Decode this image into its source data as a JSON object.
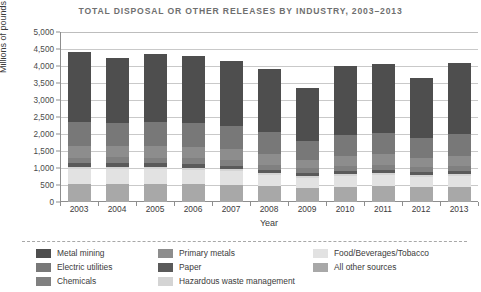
{
  "chart_data": {
    "type": "bar",
    "subtype": "stacked-bar",
    "title": "TOTAL DISPOSAL OR OTHER RELEASES BY INDUSTRY, 2003–2013",
    "xlabel": "Year",
    "ylabel": "Millions of pounds",
    "categories": [
      "2003",
      "2004",
      "2005",
      "2006",
      "2007",
      "2008",
      "2009",
      "2010",
      "2011",
      "2012",
      "2013"
    ],
    "ylim": [
      0,
      5000
    ],
    "ytick_labels": [
      "5,000",
      "4,500",
      "4,000",
      "3,500",
      "3,000",
      "2,500",
      "2,000",
      "1,500",
      "1,000",
      "500",
      "0"
    ],
    "ytick_values": [
      5000,
      4500,
      4000,
      3500,
      3000,
      2500,
      2000,
      1500,
      1000,
      500,
      0
    ],
    "grid": "horizontal",
    "legend_position": "bottom",
    "stack_order_bottom_to_top": [
      "All other sources",
      "Food/Beverages/Tobacco",
      "Hazardous waste management",
      "Paper",
      "Chemicals",
      "Primary metals",
      "Electric utilities",
      "Metal mining"
    ],
    "series": [
      {
        "name": "All other sources",
        "color": "#a8a8a8",
        "values": [
          530,
          540,
          530,
          520,
          500,
          470,
          420,
          450,
          470,
          440,
          450
        ]
      },
      {
        "name": "Food/Beverages/Tobacco",
        "color": "#e2e2e2",
        "values": [
          430,
          430,
          430,
          420,
          400,
          330,
          290,
          320,
          330,
          300,
          320
        ]
      },
      {
        "name": "Hazardous waste management",
        "color": "#d4d4d4",
        "values": [
          60,
          60,
          60,
          60,
          60,
          50,
          50,
          50,
          50,
          50,
          50
        ]
      },
      {
        "name": "Paper",
        "color": "#5a5a5a",
        "values": [
          120,
          120,
          120,
          120,
          110,
          100,
          90,
          100,
          100,
          90,
          100
        ]
      },
      {
        "name": "Chemicals",
        "color": "#808080",
        "values": [
          170,
          170,
          170,
          170,
          160,
          150,
          140,
          150,
          150,
          140,
          150
        ]
      },
      {
        "name": "Primary metals",
        "color": "#8d8d8d",
        "values": [
          330,
          320,
          330,
          330,
          320,
          300,
          260,
          280,
          300,
          270,
          290
        ]
      },
      {
        "name": "Electric utilities",
        "color": "#787878",
        "values": [
          700,
          690,
          700,
          700,
          680,
          650,
          560,
          620,
          640,
          600,
          630
        ]
      },
      {
        "name": "Metal mining",
        "color": "#4e4e4e",
        "values": [
          2060,
          1920,
          2010,
          1980,
          1920,
          1850,
          1540,
          2030,
          2010,
          1760,
          2110
        ]
      }
    ],
    "totals": [
      4400,
      4250,
      4350,
      4300,
      4150,
      3900,
      3350,
      4000,
      4050,
      3650,
      4100
    ]
  },
  "legend": {
    "columns": [
      {
        "items": [
          {
            "label": "Metal mining",
            "color": "#4e4e4e"
          },
          {
            "label": "Electric utilities",
            "color": "#787878"
          },
          {
            "label": "Chemicals",
            "color": "#808080"
          }
        ]
      },
      {
        "items": [
          {
            "label": "Primary metals",
            "color": "#8d8d8d"
          },
          {
            "label": "Paper",
            "color": "#5a5a5a"
          },
          {
            "label": "Hazardous waste management",
            "color": "#d4d4d4"
          }
        ]
      },
      {
        "items": [
          {
            "label": "Food/Beverages/Tobacco",
            "color": "#e2e2e2"
          },
          {
            "label": "All other sources",
            "color": "#a8a8a8"
          }
        ]
      }
    ]
  }
}
